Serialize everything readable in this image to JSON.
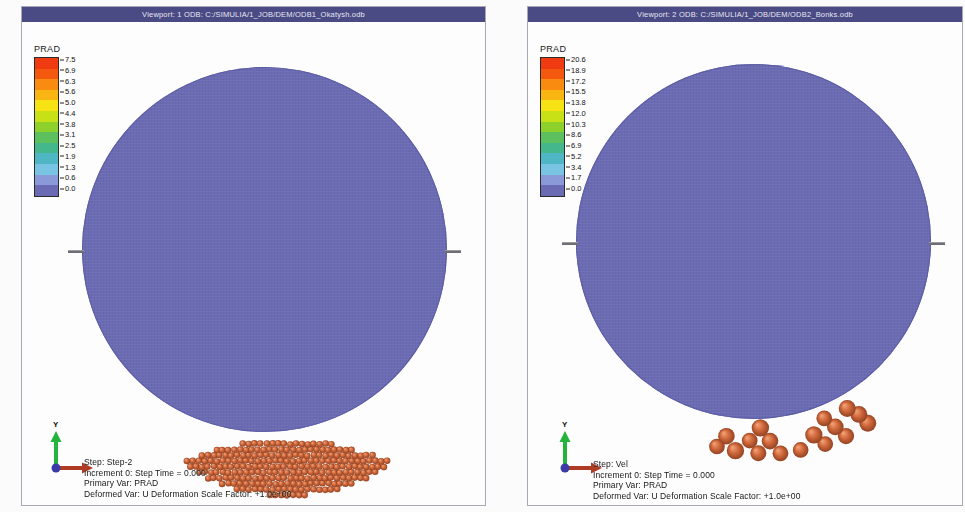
{
  "window": {
    "background_color": "#ffffff",
    "titlebar_color": "#4a4a84"
  },
  "viewports": [
    {
      "id": "viewport-1",
      "title": "Viewport: 1    ODB: C:/SIMULIA/1_JOB/DEM/ODB1_Okatysh.odb",
      "legend": {
        "title": "PRAD",
        "ticks": [
          "7.5",
          "6.9",
          "6.3",
          "5.6",
          "5.0",
          "4.4",
          "3.8",
          "3.1",
          "2.5",
          "1.9",
          "1.3",
          "0.6",
          "0.0"
        ],
        "colors": [
          "#f03a12",
          "#f4580f",
          "#f88b10",
          "#f9b511",
          "#f7e313",
          "#c8e016",
          "#8ed02c",
          "#5dc05f",
          "#45b78d",
          "#4fb6c4",
          "#79c4e2",
          "#8a9ad8",
          "#6b6bb4"
        ]
      },
      "triad": {
        "y_label": "Y",
        "y_axis_color": "#22b43c",
        "x_axis_color": "#b03b24",
        "origin_color": "#3a3aa8"
      },
      "info": [
        "Step: Step-2",
        "Increment        0: Step Time =    0.000",
        "Primary Var: PRAD",
        "Deformed Var: U   Deformation Scale Factor: +1.0e+00"
      ],
      "particle_color": "#d1693c",
      "drum_color": "#6b6bb4"
    },
    {
      "id": "viewport-2",
      "title": "Viewport: 2    ODB: C:/SIMULIA/1_JOB/DEM/ODB2_Bonks.odb",
      "legend": {
        "title": "PRAD",
        "ticks": [
          "20.6",
          "18.9",
          "17.2",
          "15.5",
          "13.8",
          "12.0",
          "10.3",
          "8.6",
          "6.9",
          "5.2",
          "3.4",
          "1.7",
          "0.0"
        ],
        "colors": [
          "#f03a12",
          "#f4580f",
          "#f88b10",
          "#f9b511",
          "#f7e313",
          "#c8e016",
          "#8ed02c",
          "#5dc05f",
          "#45b78d",
          "#4fb6c4",
          "#79c4e2",
          "#8a9ad8",
          "#6b6bb4"
        ]
      },
      "triad": {
        "y_label": "Y",
        "y_axis_color": "#22b43c",
        "x_axis_color": "#b03b24",
        "origin_color": "#3a3aa8"
      },
      "info": [
        "Step: Vel",
        "Increment        0: Step Time =    0.000",
        "Primary Var: PRAD",
        "Deformed Var: U   Deformation Scale Factor: +1.0e+00"
      ],
      "particle_color": "#d1693c",
      "drum_color": "#6b6bb4"
    }
  ]
}
